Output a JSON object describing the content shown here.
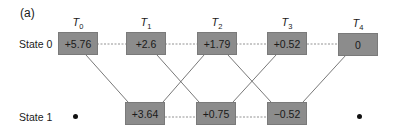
{
  "figure": {
    "panel_label": "(a)",
    "time_steps": [
      "T0",
      "T1",
      "T2",
      "T3",
      "T4"
    ],
    "time_labels": [
      {
        "base": "T",
        "sub": "0"
      },
      {
        "base": "T",
        "sub": "1"
      },
      {
        "base": "T",
        "sub": "2"
      },
      {
        "base": "T",
        "sub": "3"
      },
      {
        "base": "T",
        "sub": "4"
      }
    ],
    "states": [
      {
        "label": "State 0",
        "values": [
          "+5.76",
          "+2.6",
          "+1.79",
          "+0.52",
          "0"
        ]
      },
      {
        "label": "State 1",
        "values": [
          null,
          "+3.64",
          "+0.75",
          "−0.52",
          null
        ]
      }
    ],
    "colors": {
      "box_fill": "#8c8c8c",
      "line": "#555555",
      "dashed": "#777777"
    }
  }
}
